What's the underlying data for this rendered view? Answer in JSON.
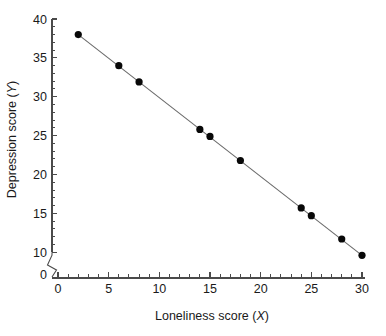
{
  "figure": {
    "background_color": "#ffffff",
    "point_color": "#080808",
    "line_color": "#6a6a6a",
    "axis_color": "#4a4a4a"
  },
  "chart_data": {
    "type": "scatter",
    "title": "",
    "xlabel": "Loneliness score (X)",
    "xlabel_text": "Loneliness score (",
    "xlabel_var": "X",
    "xlabel_close": ")",
    "ylabel": "Depression score (Y)",
    "ylabel_text": "Depression score (",
    "ylabel_var": "Y",
    "ylabel_close": ")",
    "x": [
      2,
      6,
      8,
      14,
      15,
      18,
      24,
      25,
      28,
      30
    ],
    "y": [
      38.0,
      34.0,
      31.9,
      25.8,
      24.9,
      21.8,
      15.7,
      14.7,
      11.7,
      9.6
    ],
    "points": [
      {
        "x": 2,
        "y": 38.0
      },
      {
        "x": 6,
        "y": 34.0
      },
      {
        "x": 8,
        "y": 31.9
      },
      {
        "x": 14,
        "y": 25.8
      },
      {
        "x": 15,
        "y": 24.9
      },
      {
        "x": 18,
        "y": 21.8
      },
      {
        "x": 24,
        "y": 15.7
      },
      {
        "x": 25,
        "y": 14.7
      },
      {
        "x": 28,
        "y": 11.7
      },
      {
        "x": 30,
        "y": 9.6
      }
    ],
    "series": [
      {
        "name": "observations",
        "values": [
          38.0,
          34.0,
          31.9,
          25.8,
          24.9,
          21.8,
          15.7,
          14.7,
          11.7,
          9.6
        ]
      },
      {
        "name": "regression line",
        "type": "line",
        "endpoints": [
          {
            "x": 2,
            "y": 38.0
          },
          {
            "x": 30,
            "y": 9.6
          }
        ]
      }
    ],
    "xlim": [
      0,
      30
    ],
    "ylim": [
      9,
      40
    ],
    "y_axis_break": true,
    "y_axis_break_below": 10,
    "y_origin_label": "0",
    "xticks": [
      0,
      5,
      10,
      15,
      20,
      25,
      30
    ],
    "xticklabels": [
      "0",
      "5",
      "10",
      "15",
      "20",
      "25",
      "30"
    ],
    "xtick_minor_step": 1,
    "yticks": [
      10,
      15,
      20,
      25,
      30,
      35,
      40
    ],
    "yticklabels": [
      "10",
      "15",
      "20",
      "25",
      "30",
      "35",
      "40"
    ],
    "ytick_minor_step": 1,
    "grid": false,
    "legend": null,
    "legend_position": "none"
  }
}
